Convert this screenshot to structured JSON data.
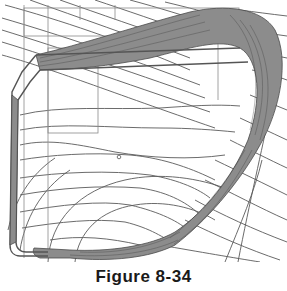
{
  "figure": {
    "caption": "Figure 8-34",
    "colors": {
      "background": "#ffffff",
      "line": "#5a5a5a",
      "band_fill": "#8c8c8c",
      "outline": "#555555"
    },
    "small_marker": {
      "x": 119,
      "y": 157,
      "shape": "circle"
    }
  }
}
